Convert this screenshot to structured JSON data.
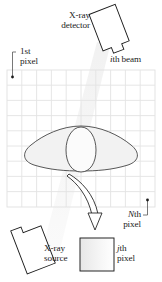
{
  "figure": {
    "caption_fragment": "",
    "background": "#ffffff",
    "ink": "#1b1b1b"
  },
  "labels": {
    "detector": "X-ray\ndetector",
    "detector_line1": "X-ray",
    "detector_line2": "detector",
    "ith_beam_italic": "i",
    "ith_beam_rest": "th beam",
    "first_pixel_line1": "1st",
    "first_pixel_line2": "pixel",
    "nth_pixel_italic": "N",
    "nth_pixel_rest": "th",
    "nth_pixel_line2": "pixel",
    "jth_pixel_italic": "j",
    "jth_pixel_rest": "th",
    "jth_pixel_line2": "pixel",
    "source_line1": "X-ray",
    "source_line2": "source"
  },
  "grid": {
    "columns": 10,
    "rows": 9,
    "x": 7,
    "y": 70,
    "width": 148,
    "height": 137,
    "cell_width": 14.8,
    "cell_height": 15.2,
    "line_color": "#e3e3e3",
    "border_color": "#dddddd"
  },
  "markers": {
    "first_pixel_dot": {
      "x": 13,
      "y": 77
    },
    "nth_pixel_dot": {
      "x": 148,
      "y": 200
    }
  },
  "shapes": {
    "detector": {
      "name": "x-ray-detector",
      "stroke": "#1b1b1b",
      "fill": "#ffffff",
      "rotation_deg": -22
    },
    "source": {
      "name": "x-ray-source",
      "stroke": "#1b1b1b",
      "fill": "#ffffff",
      "rotation_deg": -22
    },
    "body": {
      "name": "patient-cross-section",
      "stroke": "#3d3d3d",
      "fill": "#f2f2f2"
    },
    "organ": {
      "name": "inner-organ",
      "stroke": "#3d3d3d",
      "fill": "#fbfbfb"
    },
    "beam": {
      "name": "ith-beam-band",
      "fill": "#f4f4f4"
    },
    "jth_pixel_box": {
      "name": "jth-pixel-box",
      "stroke": "#1b1b1b",
      "fill_start": "#e9e9e9",
      "fill_end": "#ffffff",
      "x": 80,
      "y": 238,
      "size": 34
    },
    "arrow": {
      "name": "curved-arrow",
      "stroke": "#1b1b1b",
      "fill": "#ffffff"
    }
  },
  "colors": {
    "grid_line": "#e3e3e3",
    "ink": "#1b1b1b",
    "body_fill": "#f2f2f2",
    "beam_fill": "#f4f4f4",
    "caption_faint": "#d8d8d8"
  }
}
